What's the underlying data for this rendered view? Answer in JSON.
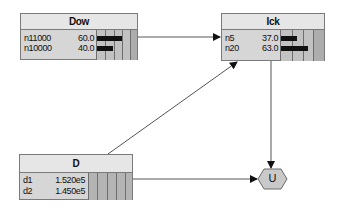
{
  "nodes": {
    "dow": {
      "title": "Dow",
      "states": [
        {
          "label": "n11000",
          "value": "60.0",
          "pct": 60
        },
        {
          "label": "n10000",
          "value": "40.0",
          "pct": 40
        }
      ]
    },
    "ick": {
      "title": "Ick",
      "states": [
        {
          "label": "n5",
          "value": "37.0",
          "pct": 37
        },
        {
          "label": "n20",
          "value": "63.0",
          "pct": 63
        }
      ]
    },
    "d": {
      "title": "D",
      "states": [
        {
          "label": "d1",
          "value": "1.520e5"
        },
        {
          "label": "d2",
          "value": "1.450e5"
        }
      ]
    },
    "u": {
      "title": "U"
    }
  },
  "edges": [
    {
      "from": "Dow",
      "to": "Ick"
    },
    {
      "from": "D",
      "to": "Ick"
    },
    {
      "from": "Ick",
      "to": "U"
    },
    {
      "from": "D",
      "to": "U"
    }
  ]
}
